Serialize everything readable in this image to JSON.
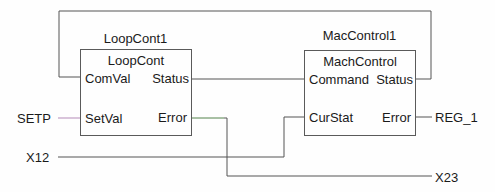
{
  "colors": {
    "wire": "#555555",
    "wire_setp": "#b48bb8",
    "wire_error": "#a8d8a0",
    "box_border": "#5a5a5a",
    "text": "#1a1a1a"
  },
  "blocks": [
    {
      "instance_name": "LoopCont1",
      "type_name": "LoopCont",
      "inputs": [
        "ComVal",
        "SetVal"
      ],
      "outputs": [
        "Status",
        "Error"
      ]
    },
    {
      "instance_name": "MacControl1",
      "type_name": "MachControl",
      "inputs": [
        "Command",
        "CurStat"
      ],
      "outputs": [
        "Status",
        "Error"
      ]
    }
  ],
  "signals": {
    "setp": "SETP",
    "x12": "X12",
    "x23": "X23",
    "reg1": "REG_1"
  }
}
